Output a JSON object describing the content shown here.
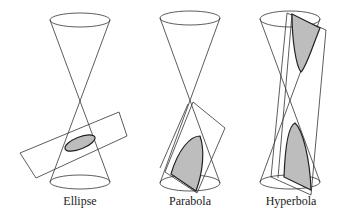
{
  "figure": {
    "panels": [
      {
        "id": "ellipse",
        "label": "Ellipse"
      },
      {
        "id": "parabola",
        "label": "Parabola"
      },
      {
        "id": "hyperbola",
        "label": "Hyperbola"
      }
    ]
  },
  "colors": {
    "line": "#333333",
    "shade": "#bdbdbd",
    "background": "#ffffff"
  }
}
